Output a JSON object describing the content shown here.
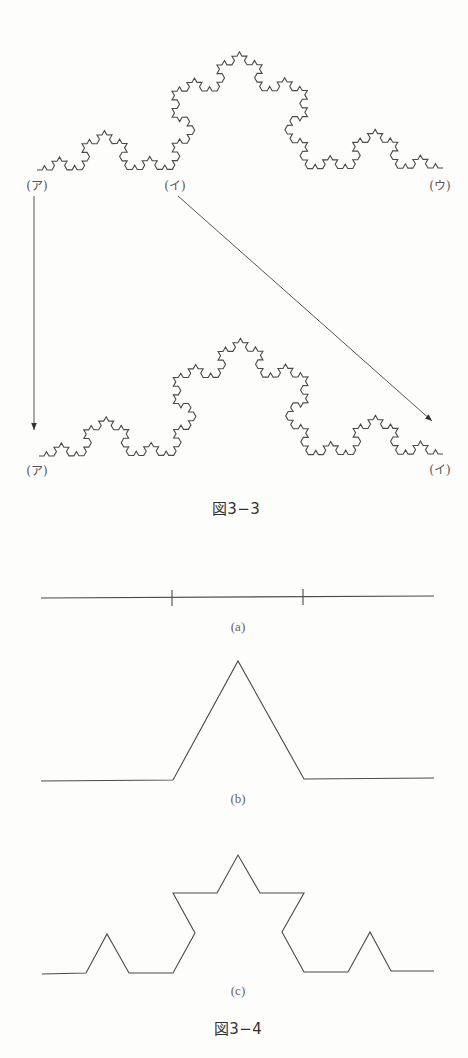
{
  "figure_3_3": {
    "caption": "図3−3",
    "top_curve": {
      "type": "koch",
      "level": 4,
      "start": [
        37,
        170
      ],
      "end": [
        443,
        168
      ]
    },
    "bottom_curve": {
      "type": "koch",
      "level": 4,
      "start": [
        39,
        456
      ],
      "end": [
        443,
        454
      ]
    },
    "labels": {
      "top_a": "(ア)",
      "top_i": "(イ)",
      "top_u": "(ウ)",
      "bottom_a": "(ア)",
      "bottom_i": "(イ)"
    },
    "arrows": [
      {
        "from": [
          34,
          196
        ],
        "to": [
          34,
          430
        ],
        "meaning": "(ア) maps to (ア)"
      },
      {
        "from": [
          178,
          196
        ],
        "to": [
          432,
          421
        ],
        "meaning": "(イ) maps to (イ)"
      }
    ]
  },
  "figure_3_4": {
    "caption": "図3−4",
    "panels": [
      {
        "label": "(a)",
        "points": [
          [
            41,
            598
          ],
          [
            434,
            596
          ]
        ],
        "ticks": [
          [
            172,
            590,
            172,
            606
          ],
          [
            303,
            589,
            303,
            605
          ]
        ]
      },
      {
        "label": "(b)",
        "points": [
          [
            41,
            781
          ],
          [
            173,
            780
          ],
          [
            238,
            661
          ],
          [
            304,
            779
          ],
          [
            434,
            778
          ]
        ]
      },
      {
        "label": "(c)",
        "points": [
          [
            42,
            974
          ],
          [
            86,
            973
          ],
          [
            107,
            934
          ],
          [
            129,
            973
          ],
          [
            173,
            973
          ],
          [
            195,
            933
          ],
          [
            173,
            893
          ],
          [
            217,
            893
          ],
          [
            238,
            855
          ],
          [
            260,
            893
          ],
          [
            304,
            893
          ],
          [
            282,
            932
          ],
          [
            304,
            972
          ],
          [
            348,
            972
          ],
          [
            370,
            932
          ],
          [
            391,
            971
          ],
          [
            434,
            971
          ]
        ]
      }
    ]
  },
  "colors": {
    "stroke": "#4a4a4a",
    "background": "#fdfdfb",
    "text": "#555555"
  }
}
